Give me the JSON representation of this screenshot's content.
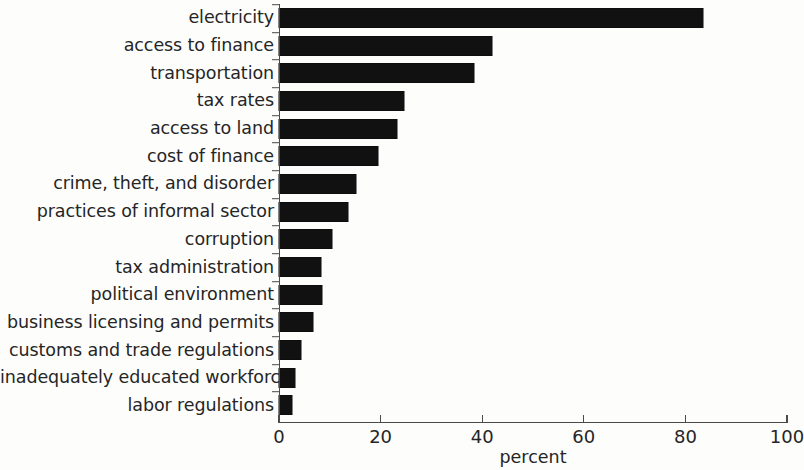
{
  "chart_data": {
    "type": "bar",
    "orientation": "horizontal",
    "title": "",
    "subtitle": "",
    "xlabel": "percent",
    "ylabel": "",
    "xlim": [
      0,
      100
    ],
    "xticks": [
      0,
      20,
      40,
      60,
      80,
      100
    ],
    "xtick_labels": [
      "0",
      "20",
      "40",
      "60",
      "80",
      "100"
    ],
    "grid": false,
    "legend": null,
    "bar_color": "#111111",
    "axis_color": "#4a4a4a",
    "text_color": "#252525",
    "background_color": "#fdfdfc",
    "categories": [
      "electricity",
      "access to finance",
      "transportation",
      "tax rates",
      "access to land",
      "cost of finance",
      "crime, theft, and disorder",
      "practices of informal sector",
      "corruption",
      "tax administration",
      "political environment",
      "business licensing and permits",
      "customs and trade regulations",
      "inadequately educated workforce",
      "labor regulations"
    ],
    "values": [
      83.5,
      42,
      38.4,
      24.6,
      23.2,
      19.5,
      15.2,
      13.5,
      10.4,
      8.2,
      8.5,
      6.7,
      4.4,
      3.1,
      2.5
    ],
    "series": [
      {
        "name": "percent",
        "values": [
          83.5,
          42,
          38.4,
          24.6,
          23.2,
          19.5,
          15.2,
          13.5,
          10.4,
          8.2,
          8.5,
          6.7,
          4.4,
          3.1,
          2.5
        ]
      }
    ]
  }
}
